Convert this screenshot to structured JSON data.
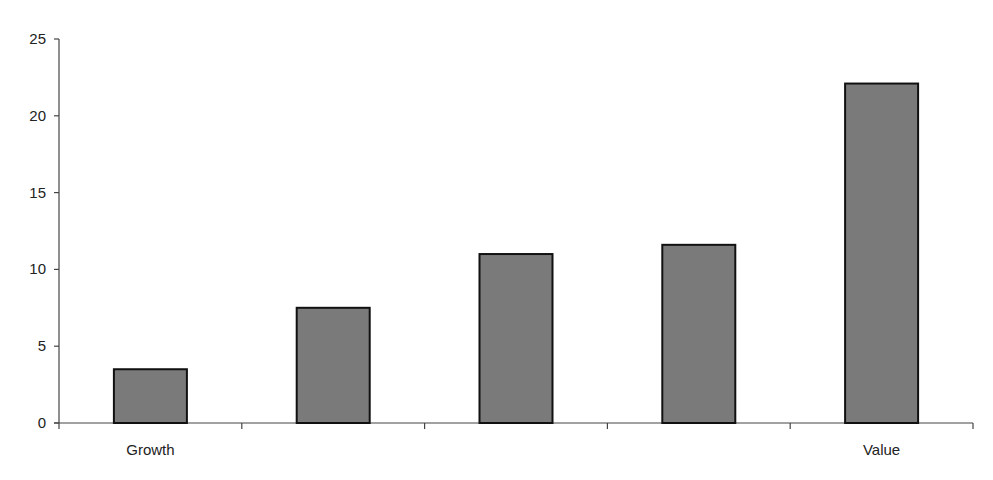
{
  "chart_data": {
    "type": "bar",
    "title": "",
    "xlabel": "",
    "ylabel": "",
    "categories": [
      "Growth",
      "",
      "",
      "",
      "Value"
    ],
    "values": [
      3.5,
      7.5,
      11.0,
      11.6,
      22.1
    ],
    "ylim": [
      0,
      25
    ],
    "yticks": [
      0,
      5,
      10,
      15,
      20,
      25
    ],
    "grid": false,
    "legend": null,
    "bar_color": "#7a7a7a",
    "bar_edge_color": "#111111"
  }
}
